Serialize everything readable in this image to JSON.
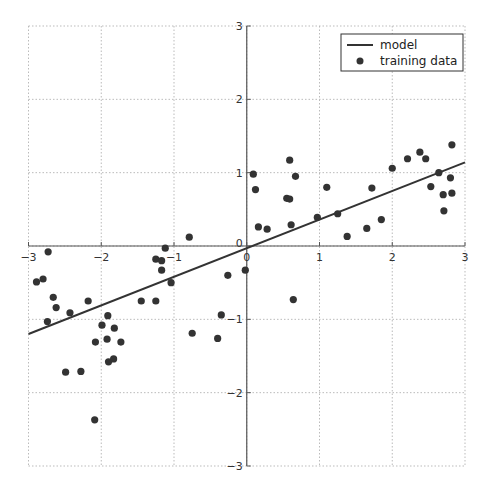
{
  "chart_data": {
    "type": "scatter",
    "title": "",
    "xlabel": "",
    "ylabel": "",
    "xlim": [
      -3,
      3
    ],
    "ylim": [
      -3,
      3
    ],
    "grid": true,
    "legend_position": "upper right",
    "x_ticks": [
      -3,
      -2,
      -1,
      0,
      1,
      2,
      3
    ],
    "y_ticks": [
      -3,
      -2,
      -1,
      0,
      1,
      2,
      3
    ],
    "x_tick_labels": [
      "−3",
      "−2",
      "−1",
      "0",
      "1",
      "2",
      "3"
    ],
    "y_tick_labels": [
      "−3",
      "−2",
      "−1",
      "0",
      "1",
      "2",
      "3"
    ],
    "legend": [
      "model",
      "training data"
    ],
    "series": [
      {
        "name": "model",
        "type": "line",
        "x": [
          -3,
          3
        ],
        "y": [
          -1.2,
          1.14
        ],
        "color": "#333333"
      },
      {
        "name": "training data",
        "type": "scatter",
        "color": "#333333",
        "points": [
          [
            -2.73,
            -0.08
          ],
          [
            -2.89,
            -0.49
          ],
          [
            -2.8,
            -0.45
          ],
          [
            -2.66,
            -0.7
          ],
          [
            -2.62,
            -0.84
          ],
          [
            -2.74,
            -1.03
          ],
          [
            -2.43,
            -0.91
          ],
          [
            -2.18,
            -0.75
          ],
          [
            -1.91,
            -0.95
          ],
          [
            -1.99,
            -1.08
          ],
          [
            -1.82,
            -1.12
          ],
          [
            -2.08,
            -1.31
          ],
          [
            -1.92,
            -1.27
          ],
          [
            -1.73,
            -1.31
          ],
          [
            -1.83,
            -1.54
          ],
          [
            -1.9,
            -1.58
          ],
          [
            -2.49,
            -1.72
          ],
          [
            -2.28,
            -1.71
          ],
          [
            -2.09,
            -2.37
          ],
          [
            -0.79,
            0.12
          ],
          [
            -1.12,
            -0.03
          ],
          [
            -1.25,
            -0.18
          ],
          [
            -1.17,
            -0.2
          ],
          [
            -1.17,
            -0.33
          ],
          [
            -1.04,
            -0.5
          ],
          [
            -1.45,
            -0.75
          ],
          [
            -1.25,
            -0.75
          ],
          [
            -0.26,
            -0.4
          ],
          [
            -0.02,
            -0.33
          ],
          [
            -0.35,
            -0.94
          ],
          [
            -0.75,
            -1.19
          ],
          [
            -0.4,
            -1.26
          ],
          [
            0.09,
            0.98
          ],
          [
            0.12,
            0.77
          ],
          [
            0.59,
            1.17
          ],
          [
            0.67,
            0.95
          ],
          [
            0.55,
            0.65
          ],
          [
            0.59,
            0.64
          ],
          [
            1.1,
            0.8
          ],
          [
            0.16,
            0.26
          ],
          [
            0.28,
            0.23
          ],
          [
            0.61,
            0.29
          ],
          [
            0.97,
            0.39
          ],
          [
            1.25,
            0.44
          ],
          [
            1.38,
            0.13
          ],
          [
            0.64,
            -0.73
          ],
          [
            1.65,
            0.24
          ],
          [
            1.85,
            0.36
          ],
          [
            1.72,
            0.79
          ],
          [
            2.0,
            1.06
          ],
          [
            2.21,
            1.19
          ],
          [
            2.38,
            1.28
          ],
          [
            2.46,
            1.19
          ],
          [
            2.64,
            1.0
          ],
          [
            2.53,
            0.81
          ],
          [
            2.8,
            0.93
          ],
          [
            2.7,
            0.7
          ],
          [
            2.82,
            0.72
          ],
          [
            2.71,
            0.48
          ],
          [
            2.82,
            1.38
          ]
        ]
      }
    ]
  },
  "legend": {
    "model_label": "model",
    "training_label": "training data"
  }
}
